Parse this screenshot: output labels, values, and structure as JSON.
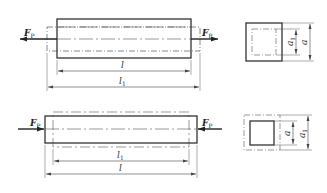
{
  "diagram": {
    "type": "engineering-drawing",
    "top_view": {
      "force_left": {
        "symbol": "F",
        "subscript": "P",
        "direction": "left"
      },
      "force_right": {
        "symbol": "F",
        "subscript": "P",
        "direction": "right"
      },
      "dim_inner": {
        "symbol": "l",
        "subscript": ""
      },
      "dim_outer": {
        "symbol": "l",
        "subscript": "1"
      },
      "section_inner": {
        "symbol": "a",
        "subscript": "1"
      },
      "section_outer": {
        "symbol": "a",
        "subscript": ""
      }
    },
    "bottom_view": {
      "force_left": {
        "symbol": "F",
        "subscript": "P",
        "direction": "right"
      },
      "force_right": {
        "symbol": "F",
        "subscript": "P",
        "direction": "left"
      },
      "dim_inner": {
        "symbol": "l",
        "subscript": "1"
      },
      "dim_outer": {
        "symbol": "l",
        "subscript": ""
      },
      "section_inner": {
        "symbol": "a",
        "subscript": ""
      },
      "section_outer": {
        "symbol": "a",
        "subscript": "1"
      }
    },
    "colors": {
      "line": "#333333",
      "thin": "#555555",
      "background": "#ffffff"
    }
  }
}
